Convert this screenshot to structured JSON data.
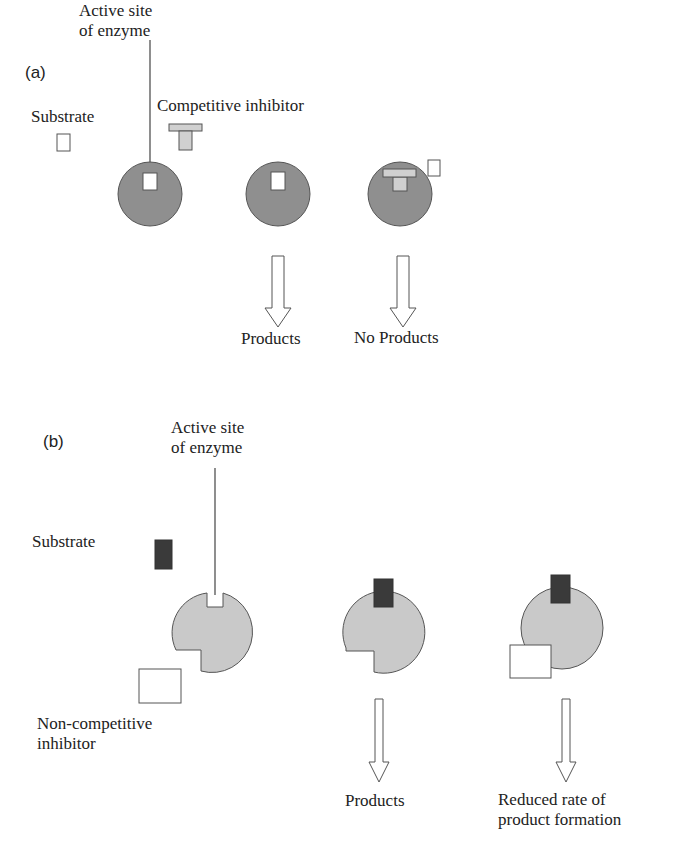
{
  "panel_a": {
    "tag": "(a)",
    "active_site_label_1": "Active site",
    "active_site_label_2": "of enzyme",
    "substrate_label": "Substrate",
    "inhibitor_label": "Competitive inhibitor",
    "products_label": "Products",
    "no_products_label": "No Products"
  },
  "panel_b": {
    "tag": "(b)",
    "active_site_label_1": "Active site",
    "active_site_label_2": "of enzyme",
    "substrate_label": "Substrate",
    "inhibitor_label_1": "Non-competitive",
    "inhibitor_label_2": "inhibitor",
    "products_label": "Products",
    "reduced_label_1": "Reduced rate of",
    "reduced_label_2": "product formation"
  },
  "colors": {
    "enzyme_a": "#8f8f8f",
    "enzyme_b": "#c9c9c9",
    "substrate_b": "#3a3a3a",
    "inhibitor_a": "#d0d0d0",
    "outline": "#555555"
  }
}
